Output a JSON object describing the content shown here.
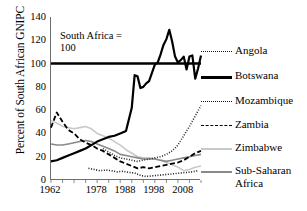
{
  "chart_data": {
    "type": "line",
    "title": "",
    "xlabel": "",
    "ylabel": "Percent of South African GNIPC",
    "ylim": [
      0,
      140
    ],
    "ytick_values": [
      0,
      20,
      40,
      60,
      80,
      100,
      120,
      140
    ],
    "xlim": [
      1962,
      2014
    ],
    "xtick_values": [
      1962,
      1978,
      1988,
      1998,
      2008
    ],
    "grid": false,
    "legend_position": "right",
    "annotation": {
      "line1": "South Africa =",
      "line2": "100",
      "reference_value": 100
    },
    "series": [
      {
        "name": "Angola",
        "style": "dotted",
        "color": "#1a1a1a",
        "x": [
          1975,
          1977,
          1979,
          1981,
          1983,
          1985,
          1987,
          1989,
          1991,
          1993,
          1995,
          1997,
          1999,
          2001,
          2003,
          2005,
          2007,
          2009,
          2011,
          2013
        ],
        "values": [
          10,
          9,
          8,
          8.5,
          8,
          7,
          7.5,
          6.5,
          6,
          4,
          3,
          3.5,
          4,
          4.5,
          5,
          5.5,
          6,
          6.5,
          7,
          8
        ]
      },
      {
        "name": "Botswana",
        "style": "solid-thick",
        "color": "#000000",
        "x": [
          1962,
          1964,
          1966,
          1968,
          1970,
          1972,
          1974,
          1976,
          1978,
          1980,
          1982,
          1984,
          1986,
          1988,
          1990,
          1991,
          1992,
          1993,
          1994,
          1995,
          1996,
          1997,
          1998,
          1999,
          2000,
          2001,
          2002,
          2003,
          2004,
          2005,
          2006,
          2007,
          2008,
          2009,
          2010,
          2011,
          2012,
          2013,
          2014
        ],
        "values": [
          16,
          17,
          19,
          21,
          23,
          25,
          27,
          30,
          33,
          35,
          37,
          38,
          40,
          42,
          62,
          90,
          89,
          79,
          80,
          83,
          85,
          92,
          99,
          101,
          108,
          116,
          121,
          129,
          119,
          106,
          101,
          103,
          106,
          95,
          106,
          107,
          87,
          96,
          107
        ]
      },
      {
        "name": "Mozambique",
        "style": "dotted",
        "color": "#2b2b2b",
        "x": [
          1980,
          1982,
          1984,
          1986,
          1988,
          1990,
          1992,
          1994,
          1996,
          1998,
          2000,
          2002,
          2004,
          2006,
          2008,
          2010,
          2012,
          2014
        ],
        "values": [
          27,
          24,
          21,
          19,
          18,
          17,
          16,
          17,
          18,
          19,
          20,
          22,
          25,
          30,
          38,
          46,
          55,
          64
        ]
      },
      {
        "name": "Zambia",
        "style": "dashed",
        "color": "#000000",
        "x": [
          1962,
          1964,
          1966,
          1968,
          1970,
          1972,
          1974,
          1976,
          1978,
          1980,
          1982,
          1984,
          1986,
          1988,
          1990,
          1992,
          1994,
          1996,
          1998,
          2000,
          2002,
          2004,
          2006,
          2008,
          2010,
          2012,
          2014
        ],
        "values": [
          45,
          58,
          50,
          43,
          40,
          35,
          32,
          30,
          27,
          25,
          22,
          19,
          16,
          14,
          12,
          10,
          11,
          10,
          11,
          12,
          13,
          14,
          15,
          17,
          20,
          23,
          25
        ]
      },
      {
        "name": "Zimbabwe",
        "style": "solid-light",
        "color": "#c9c9c9",
        "x": [
          1962,
          1964,
          1966,
          1968,
          1970,
          1972,
          1974,
          1976,
          1978,
          1980,
          1982,
          1984,
          1986,
          1988,
          1990,
          1992,
          1994,
          1996,
          1998,
          2000,
          2002,
          2004,
          2006,
          2008,
          2010,
          2012,
          2014
        ],
        "values": [
          51,
          49,
          46,
          45,
          44,
          45,
          46,
          44,
          40,
          38,
          36,
          33,
          30,
          26,
          23,
          20,
          19,
          19,
          18,
          17,
          15,
          13,
          11,
          8,
          9,
          11,
          12
        ]
      },
      {
        "name": "Sub-Saharan Africa",
        "style": "solid-medium",
        "color": "#8a8a8a",
        "x": [
          1962,
          1964,
          1966,
          1968,
          1970,
          1972,
          1974,
          1976,
          1978,
          1980,
          1982,
          1984,
          1986,
          1988,
          1990,
          1992,
          1994,
          1996,
          1998,
          2000,
          2002,
          2004,
          2006,
          2008,
          2010,
          2012,
          2014
        ],
        "values": [
          31,
          30,
          30,
          31,
          32,
          33,
          34,
          33,
          31,
          29,
          27,
          25,
          22,
          21,
          20,
          19,
          18,
          18,
          18,
          17,
          16,
          17,
          18,
          19,
          20,
          21,
          22
        ]
      }
    ]
  },
  "legend": {
    "items": [
      {
        "label": "Angola",
        "sample": "dotted"
      },
      {
        "label": "Botswana",
        "sample": "solid-thick"
      },
      {
        "label": "Mozambique",
        "sample": "dotted"
      },
      {
        "label": "Zambia",
        "sample": "dashed"
      },
      {
        "label": "Zimbabwe",
        "sample": "solid-light"
      },
      {
        "label": "Sub-Saharan Africa",
        "sample": "solid-medium"
      }
    ]
  },
  "axes": {
    "y_title": "Percent of South African GNIPC",
    "y_ticks": [
      "0",
      "20",
      "40",
      "60",
      "80",
      "100",
      "120",
      "140"
    ],
    "x_ticks": [
      "1962",
      "1978",
      "1988",
      "1998",
      "2008"
    ]
  },
  "colors": {
    "axis": "#6e6e6e",
    "text": "#000000",
    "zimbabwe": "#c9c9c9",
    "subsaharan": "#8a8a8a"
  }
}
